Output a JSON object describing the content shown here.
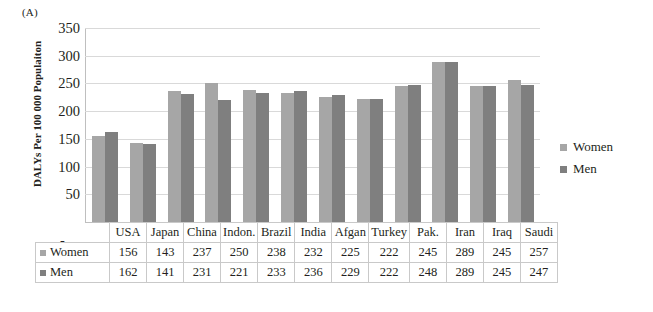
{
  "panel": {
    "label": "(A)"
  },
  "legend": {
    "position": "right",
    "items": [
      {
        "name": "Women",
        "icon": "square-swatch-icon",
        "color": "#a6a6a6"
      },
      {
        "name": "Men",
        "icon": "square-swatch-icon",
        "color": "#7f7f7f"
      }
    ]
  },
  "axis": {
    "ylabel": "DALYs Per 100 000 Populaiton",
    "yticks": [
      350,
      300,
      250,
      200,
      150,
      100,
      50
    ],
    "zero_tick": "-"
  },
  "table": {
    "row_headers": [
      "Women",
      "Men"
    ],
    "columns": [
      "USA",
      "Japan",
      "China",
      "Indon.",
      "Brazil",
      "India",
      "Afgan",
      "Turkey",
      "Pak.",
      "Iran",
      "Iraq",
      "Saudi"
    ],
    "rows": [
      {
        "label": "Women",
        "swatch": "#a6a6a6",
        "values": [
          156,
          143,
          237,
          250,
          238,
          232,
          225,
          222,
          245,
          289,
          245,
          257
        ]
      },
      {
        "label": "Men",
        "swatch": "#7f7f7f",
        "values": [
          162,
          141,
          231,
          221,
          233,
          236,
          229,
          222,
          248,
          289,
          245,
          247
        ]
      }
    ]
  },
  "chart_data": {
    "type": "bar",
    "title": "(A)",
    "categories": [
      "USA",
      "Japan",
      "China",
      "Indon.",
      "Brazil",
      "India",
      "Afgan",
      "Turkey",
      "Pak.",
      "Iran",
      "Iraq",
      "Saudi"
    ],
    "series": [
      {
        "name": "Women",
        "color": "#a6a6a6",
        "values": [
          156,
          143,
          237,
          250,
          238,
          232,
          225,
          222,
          245,
          289,
          245,
          257
        ]
      },
      {
        "name": "Men",
        "color": "#7f7f7f",
        "values": [
          162,
          141,
          231,
          221,
          233,
          236,
          229,
          222,
          248,
          289,
          245,
          247
        ]
      }
    ],
    "xlabel": "",
    "ylabel": "DALYs Per 100 000 Populaiton",
    "ylim": [
      0,
      350
    ],
    "ytick_step": 50,
    "yticks": [
      0,
      50,
      100,
      150,
      200,
      250,
      300,
      350
    ],
    "grid": "horizontal",
    "legend_position": "right"
  }
}
